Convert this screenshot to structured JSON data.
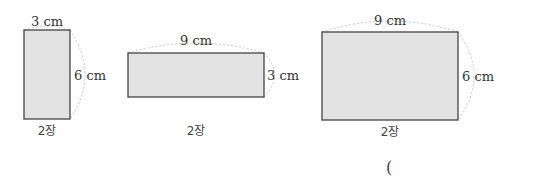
{
  "figures": [
    {
      "width_label": "3 cm",
      "height_label": "6 cm",
      "count_label": "2장",
      "width": 3,
      "height": 6,
      "count": 2
    },
    {
      "width_label": "9 cm",
      "height_label": "3 cm",
      "count_label": "2장",
      "width": 9,
      "height": 3,
      "count": 2
    },
    {
      "width_label": "9 cm",
      "height_label": "6 cm",
      "count_label": "2장",
      "width": 9,
      "height": 6,
      "count": 2
    }
  ],
  "answer_blank": {
    "open_paren": "("
  },
  "colors": {
    "fill": "#e3e3e3",
    "stroke": "#444444",
    "dashed_arc": "#bbbbbb"
  }
}
